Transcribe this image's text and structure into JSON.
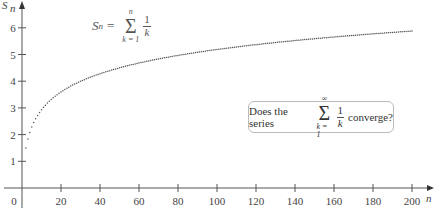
{
  "chart_data": {
    "type": "scatter",
    "title": "",
    "xlabel": "n",
    "ylabel": "S_n",
    "xlim": [
      0,
      200
    ],
    "ylim": [
      0,
      6.5
    ],
    "x_ticks": [
      "0",
      "20",
      "40",
      "60",
      "80",
      "100",
      "120",
      "140",
      "160",
      "180",
      "200"
    ],
    "y_ticks": [
      "1",
      "2",
      "3",
      "4",
      "5",
      "6"
    ],
    "grid": false,
    "series": [
      {
        "name": "S_n = sum_{k=1}^{n} 1/k",
        "function": "harmonic partial sums",
        "n_range": [
          1,
          200
        ],
        "sample_points": [
          [
            1,
            1.0
          ],
          [
            2,
            1.5
          ],
          [
            5,
            2.28
          ],
          [
            10,
            2.93
          ],
          [
            20,
            3.6
          ],
          [
            40,
            4.28
          ],
          [
            60,
            4.68
          ],
          [
            80,
            4.97
          ],
          [
            100,
            5.19
          ],
          [
            120,
            5.37
          ],
          [
            140,
            5.52
          ],
          [
            160,
            5.66
          ],
          [
            180,
            5.77
          ],
          [
            200,
            5.88
          ]
        ]
      }
    ],
    "annotations": {
      "formula": {
        "lhs": "S",
        "lhs_sub": "n",
        "eq": "=",
        "sum_upper": "n",
        "sum_lower": "k = 1",
        "num": "1",
        "den": "k"
      },
      "question": {
        "prefix": "Does the series",
        "sum_upper": "∞",
        "sum_lower": "k = 1",
        "num": "1",
        "den": "k",
        "suffix": "converge?"
      }
    }
  },
  "axis": {
    "x_label": "n",
    "y_label": "S",
    "y_label_sub": "n",
    "origin": "0"
  }
}
